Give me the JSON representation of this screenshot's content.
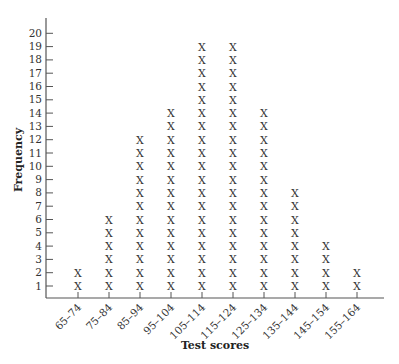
{
  "chart_data": {
    "type": "dot_plot",
    "title": "",
    "xlabel": "Test scores",
    "ylabel": "Frequency",
    "categories": [
      "65–74",
      "75–84",
      "85–94",
      "95–104",
      "105–114",
      "115–124",
      "125–134",
      "135–144",
      "145–154",
      "155–164"
    ],
    "values": [
      2,
      6,
      12,
      14,
      19,
      19,
      14,
      8,
      4,
      2
    ],
    "marker": "X",
    "ylim": [
      0,
      20
    ],
    "yticks": [
      1,
      2,
      3,
      4,
      5,
      6,
      7,
      8,
      9,
      10,
      11,
      12,
      13,
      14,
      15,
      16,
      17,
      18,
      19,
      20
    ],
    "grid": false,
    "legend": null
  },
  "colors": {
    "axis": "#555555",
    "text": "#333333",
    "marker": "#333333"
  }
}
